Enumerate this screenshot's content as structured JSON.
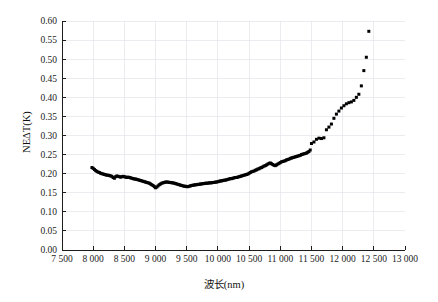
{
  "chart_data": {
    "type": "scatter",
    "title": "",
    "xlabel": "波长(nm)",
    "ylabel": "NEΔT(K)",
    "xlim": [
      7500,
      13000
    ],
    "ylim": [
      0.0,
      0.6
    ],
    "xticks": [
      7500,
      8000,
      8500,
      9000,
      9500,
      10000,
      10500,
      11000,
      11500,
      12000,
      12500,
      13000
    ],
    "xtick_labels": [
      "7 500",
      "8 000",
      "8 500",
      "9 000",
      "9 500",
      "10 000",
      "10 500",
      "11 000",
      "11 500",
      "12 000",
      "12 500",
      "13 000"
    ],
    "yticks": [
      0.0,
      0.05,
      0.1,
      0.15,
      0.2,
      0.25,
      0.3,
      0.35,
      0.4,
      0.45,
      0.5,
      0.55,
      0.6
    ],
    "ytick_labels": [
      "0.00",
      "0.05",
      "0.10",
      "0.15",
      "0.20",
      "0.25",
      "0.30",
      "0.35",
      "0.40",
      "0.45",
      "0.50",
      "0.55",
      "0.60"
    ],
    "grid": true,
    "legend": "none",
    "marker": "square",
    "marker_color": "#000000",
    "series": [
      {
        "name": "NEΔT",
        "x": [
          7980,
          8000,
          8020,
          8040,
          8060,
          8080,
          8100,
          8120,
          8140,
          8160,
          8180,
          8200,
          8220,
          8240,
          8260,
          8280,
          8300,
          8320,
          8340,
          8360,
          8380,
          8400,
          8420,
          8440,
          8460,
          8480,
          8500,
          8520,
          8540,
          8560,
          8580,
          8600,
          8620,
          8640,
          8660,
          8680,
          8700,
          8720,
          8740,
          8760,
          8780,
          8800,
          8820,
          8840,
          8860,
          8880,
          8900,
          8920,
          8940,
          8960,
          8980,
          9000,
          9020,
          9040,
          9060,
          9080,
          9100,
          9120,
          9140,
          9160,
          9180,
          9200,
          9220,
          9240,
          9260,
          9280,
          9300,
          9320,
          9340,
          9360,
          9380,
          9400,
          9420,
          9440,
          9460,
          9480,
          9500,
          9520,
          9540,
          9560,
          9580,
          9600,
          9620,
          9640,
          9660,
          9680,
          9700,
          9720,
          9740,
          9760,
          9780,
          9800,
          9820,
          9840,
          9860,
          9880,
          9900,
          9920,
          9940,
          9960,
          9980,
          10000,
          10020,
          10040,
          10060,
          10080,
          10100,
          10120,
          10140,
          10160,
          10180,
          10200,
          10220,
          10240,
          10260,
          10280,
          10300,
          10320,
          10340,
          10360,
          10380,
          10400,
          10420,
          10440,
          10460,
          10480,
          10500,
          10520,
          10540,
          10560,
          10580,
          10600,
          10620,
          10640,
          10660,
          10680,
          10700,
          10720,
          10740,
          10760,
          10780,
          10800,
          10820,
          10840,
          10860,
          10880,
          10900,
          10920,
          10940,
          10960,
          10980,
          11000,
          11020,
          11040,
          11060,
          11080,
          11100,
          11120,
          11140,
          11160,
          11180,
          11200,
          11220,
          11240,
          11260,
          11280,
          11300,
          11320,
          11340,
          11360,
          11380,
          11400,
          11420,
          11440,
          11460,
          11480,
          11500,
          11540,
          11580,
          11620,
          11660,
          11700,
          11740,
          11780,
          11820,
          11860,
          11900,
          11940,
          11980,
          12020,
          12060,
          12100,
          12140,
          12180,
          12220,
          12260,
          12300,
          12340,
          12380,
          12420
        ],
        "y": [
          0.216,
          0.214,
          0.211,
          0.208,
          0.206,
          0.204,
          0.203,
          0.201,
          0.2,
          0.199,
          0.198,
          0.197,
          0.196,
          0.196,
          0.195,
          0.194,
          0.193,
          0.19,
          0.188,
          0.192,
          0.194,
          0.193,
          0.192,
          0.191,
          0.192,
          0.193,
          0.192,
          0.191,
          0.19,
          0.191,
          0.19,
          0.189,
          0.188,
          0.187,
          0.186,
          0.186,
          0.185,
          0.184,
          0.183,
          0.182,
          0.181,
          0.18,
          0.179,
          0.178,
          0.177,
          0.176,
          0.175,
          0.173,
          0.171,
          0.169,
          0.166,
          0.163,
          0.165,
          0.168,
          0.171,
          0.173,
          0.175,
          0.176,
          0.177,
          0.178,
          0.178,
          0.178,
          0.177,
          0.177,
          0.176,
          0.176,
          0.175,
          0.174,
          0.173,
          0.172,
          0.171,
          0.17,
          0.169,
          0.168,
          0.167,
          0.167,
          0.166,
          0.166,
          0.167,
          0.168,
          0.169,
          0.17,
          0.17,
          0.171,
          0.171,
          0.172,
          0.172,
          0.173,
          0.173,
          0.174,
          0.174,
          0.175,
          0.175,
          0.175,
          0.176,
          0.176,
          0.176,
          0.177,
          0.177,
          0.178,
          0.178,
          0.179,
          0.18,
          0.181,
          0.181,
          0.182,
          0.183,
          0.183,
          0.184,
          0.185,
          0.186,
          0.187,
          0.187,
          0.188,
          0.189,
          0.19,
          0.19,
          0.191,
          0.192,
          0.193,
          0.194,
          0.195,
          0.196,
          0.197,
          0.198,
          0.199,
          0.201,
          0.203,
          0.205,
          0.206,
          0.207,
          0.209,
          0.21,
          0.212,
          0.213,
          0.215,
          0.216,
          0.218,
          0.22,
          0.221,
          0.223,
          0.225,
          0.227,
          0.228,
          0.226,
          0.224,
          0.222,
          0.221,
          0.223,
          0.225,
          0.227,
          0.229,
          0.231,
          0.232,
          0.233,
          0.234,
          0.236,
          0.237,
          0.238,
          0.24,
          0.241,
          0.242,
          0.243,
          0.244,
          0.245,
          0.246,
          0.247,
          0.248,
          0.25,
          0.251,
          0.252,
          0.253,
          0.254,
          0.256,
          0.258,
          0.262,
          0.279,
          0.283,
          0.29,
          0.293,
          0.292,
          0.294,
          0.315,
          0.322,
          0.33,
          0.345,
          0.356,
          0.364,
          0.372,
          0.378,
          0.383,
          0.386,
          0.388,
          0.392,
          0.4,
          0.408,
          0.43,
          0.47,
          0.505,
          0.573
        ]
      }
    ]
  }
}
